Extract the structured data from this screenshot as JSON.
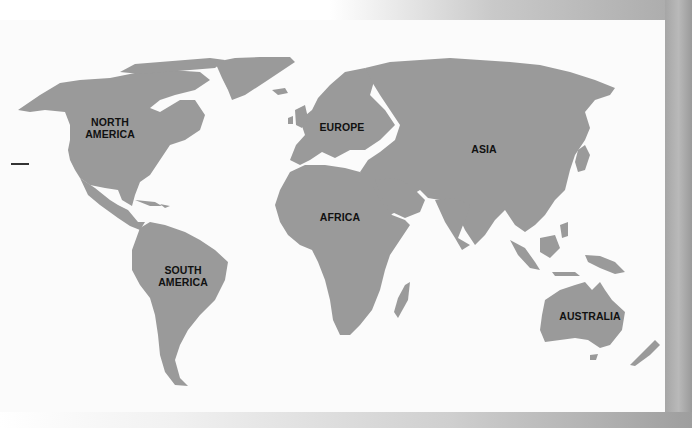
{
  "map": {
    "type": "world-continents",
    "land_color": "#9a9a9a",
    "water_color": "#fbfbfb",
    "label_color": "#111111",
    "labels": {
      "north_america_1": "NORTH",
      "north_america_2": "AMERICA",
      "south_america_1": "SOUTH",
      "south_america_2": "AMERICA",
      "europe": "EUROPE",
      "asia": "ASIA",
      "africa": "AFRICA",
      "australia": "AUSTRALIA"
    }
  }
}
